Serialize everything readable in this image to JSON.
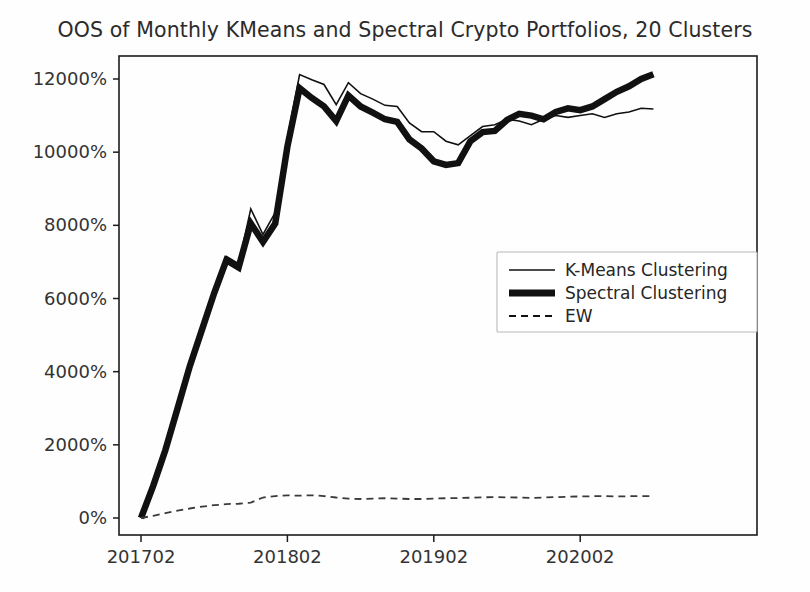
{
  "chart_data": {
    "type": "line",
    "title": "OOS of Monthly KMeans and Spectral Crypto Portfolios, 20 Clusters",
    "xlabel": "",
    "ylabel": "",
    "grid": false,
    "legend_position": "center-right",
    "xlim": [
      0,
      43
    ],
    "ylim": [
      -500,
      12600
    ],
    "x": [
      "201702",
      "201703",
      "201704",
      "201705",
      "201706",
      "201707",
      "201708",
      "201709",
      "201710",
      "201711",
      "201712",
      "201801",
      "201802",
      "201803",
      "201804",
      "201805",
      "201806",
      "201807",
      "201808",
      "201809",
      "201810",
      "201811",
      "201812",
      "201901",
      "201902",
      "201903",
      "201904",
      "201905",
      "201906",
      "201907",
      "201908",
      "201909",
      "201910",
      "201911",
      "201912",
      "202001",
      "202002",
      "202003",
      "202004",
      "202005",
      "202006",
      "202007",
      "202008"
    ],
    "xticks": [
      "201702",
      "201802",
      "201902",
      "202002"
    ],
    "xtick_positions": [
      0,
      12,
      24,
      36
    ],
    "yticks": [
      "0%",
      "2000%",
      "4000%",
      "6000%",
      "8000%",
      "10000%",
      "12000%"
    ],
    "ytick_values": [
      0,
      2000,
      4000,
      6000,
      8000,
      10000,
      12000
    ],
    "series": [
      {
        "name": "K-Means Clustering",
        "style": "solid",
        "linewidth": 1.6,
        "color": "#111111",
        "values": [
          0,
          900,
          1900,
          3050,
          4200,
          5250,
          6250,
          7150,
          6950,
          8450,
          7750,
          8350,
          10400,
          12120,
          11980,
          11850,
          11300,
          11900,
          11600,
          11450,
          11280,
          11250,
          10800,
          10560,
          10560,
          10300,
          10200,
          10450,
          10700,
          10750,
          10900,
          10850,
          10750,
          10900,
          11000,
          10950,
          11000,
          11050,
          10950,
          11050,
          11100,
          11200,
          11180
        ]
      },
      {
        "name": "Spectral Clustering",
        "style": "solid",
        "linewidth": 6.5,
        "color": "#111111",
        "values": [
          0,
          880,
          1860,
          3000,
          4150,
          5150,
          6150,
          7050,
          6850,
          8050,
          7550,
          8050,
          10150,
          11750,
          11480,
          11250,
          10850,
          11550,
          11250,
          11080,
          10900,
          10830,
          10350,
          10100,
          9750,
          9650,
          9700,
          10300,
          10550,
          10580,
          10880,
          11050,
          11000,
          10900,
          11100,
          11200,
          11150,
          11250,
          11450,
          11650,
          11800,
          12000,
          12130
        ]
      },
      {
        "name": "EW",
        "style": "dashed",
        "linewidth": 1.8,
        "color": "#3a3a3a",
        "values": [
          0,
          60,
          130,
          200,
          260,
          310,
          350,
          380,
          390,
          420,
          560,
          600,
          620,
          610,
          620,
          600,
          560,
          530,
          520,
          530,
          540,
          530,
          520,
          520,
          530,
          540,
          545,
          555,
          565,
          570,
          565,
          560,
          550,
          560,
          570,
          580,
          590,
          595,
          600,
          590,
          595,
          600,
          600
        ]
      }
    ]
  },
  "legend": {
    "entries": [
      {
        "label": "K-Means Clustering",
        "style": "solid",
        "linewidth": 1.6
      },
      {
        "label": "Spectral Clustering",
        "style": "solid",
        "linewidth": 7
      },
      {
        "label": "EW",
        "style": "dashed",
        "linewidth": 1.8
      }
    ]
  },
  "axes": {
    "plot_left": 119,
    "plot_right": 757,
    "plot_top": 56,
    "plot_bottom": 535
  }
}
